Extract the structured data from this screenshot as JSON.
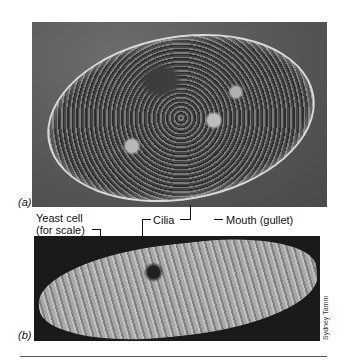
{
  "figure": {
    "panels": [
      {
        "id": "a",
        "letter": "(a)",
        "description": "Light micrograph of Paramecium cell"
      },
      {
        "id": "b",
        "letter": "(b)",
        "description": "Scanning electron micrograph of Paramecium surface"
      }
    ],
    "labels": {
      "yeast": "Yeast cell",
      "yeast_sub": "(for scale)",
      "cilia": "Cilia",
      "mouth": "Mouth (gullet)"
    },
    "credit": "Sydney Tamm"
  }
}
